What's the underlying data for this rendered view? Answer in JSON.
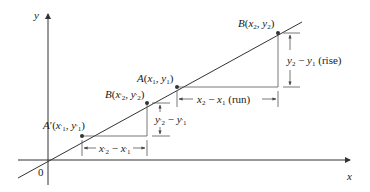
{
  "diagram": {
    "axes": {
      "x_label": "x",
      "y_label": "y",
      "origin_label": "0"
    },
    "points": {
      "A_prime": {
        "name": "A′",
        "coords": "(x′1, y′1)",
        "label": "A′(x′1, y′1)"
      },
      "B_prime": {
        "name": "B",
        "coords": "(x′2, y′2)",
        "label": "B(x′2, y′2)"
      },
      "A": {
        "name": "A",
        "coords": "(x1, y1)",
        "label": "A(x1, y1)"
      },
      "B": {
        "name": "B",
        "coords": "(x2, y2)",
        "label": "B(x2, y2)"
      }
    },
    "measurements": {
      "small_run": "x′2 − x′1",
      "small_rise": "y′2 − y′1",
      "run": "x2 − x1 (run)",
      "rise": "y2 − y1 (rise)"
    },
    "colors": {
      "line": "#333333",
      "text": "#1a1a1a",
      "background": "#ffffff"
    }
  }
}
